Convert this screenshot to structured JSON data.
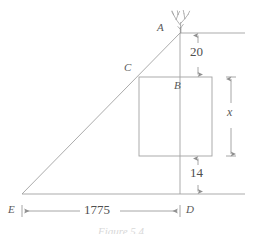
{
  "figure": {
    "caption": "Figure 5.4",
    "stroke_color": "#9a9a9a",
    "text_color": "#545454",
    "background": "#ffffff"
  },
  "points": [
    {
      "id": "A",
      "label": "A",
      "x": 180,
      "y": 33,
      "label_x": 159,
      "label_y": 26
    },
    {
      "id": "B",
      "label": "B",
      "x": 180,
      "y": 77,
      "label_x": 175,
      "label_y": 83
    },
    {
      "id": "C",
      "label": "C",
      "x": 139,
      "y": 77,
      "label_x": 126,
      "label_y": 67
    },
    {
      "id": "D",
      "label": "D",
      "x": 180,
      "y": 194,
      "label_x": 186,
      "label_y": 199
    },
    {
      "id": "E",
      "label": "E",
      "x": 22,
      "y": 194,
      "label_x": 9,
      "label_y": 199
    }
  ],
  "dimensions": [
    {
      "id": "dim-20",
      "value": "20",
      "orientation": "vertical",
      "from": 33,
      "to": 77,
      "axis_x": 198,
      "label_x": 192,
      "label_y": 48
    },
    {
      "id": "dim-x",
      "value": "x",
      "orientation": "vertical",
      "from": 77,
      "to": 156,
      "axis_x": 231,
      "label_x": 228,
      "label_y": 111,
      "italic": true
    },
    {
      "id": "dim-14",
      "value": "14",
      "orientation": "vertical",
      "from": 156,
      "to": 194,
      "axis_x": 198,
      "label_x": 192,
      "label_y": 169
    },
    {
      "id": "dim-1775",
      "value": "1775",
      "orientation": "horizontal",
      "from": 22,
      "to": 180,
      "axis_y": 211,
      "label_x": 87,
      "label_y": 205
    }
  ],
  "shapes": {
    "rectangle": {
      "x": 139,
      "y": 77,
      "width": 73,
      "height": 79
    },
    "triangle": {
      "apex_x": 180,
      "apex_y": 33,
      "left_x": 22,
      "left_y": 194,
      "right_x": 180,
      "right_y": 194
    },
    "top_ground_line": {
      "x1": 180,
      "y1": 33,
      "x2": 245,
      "y2": 33
    },
    "bottom_ground_line": {
      "x1": 22,
      "y1": 194,
      "x2": 245,
      "y2": 194
    },
    "vertical_axis": {
      "x": 180,
      "y1": 33,
      "y2": 194
    }
  },
  "icons": {
    "tree": {
      "name": "tree-icon",
      "x": 180,
      "y": 33
    }
  }
}
